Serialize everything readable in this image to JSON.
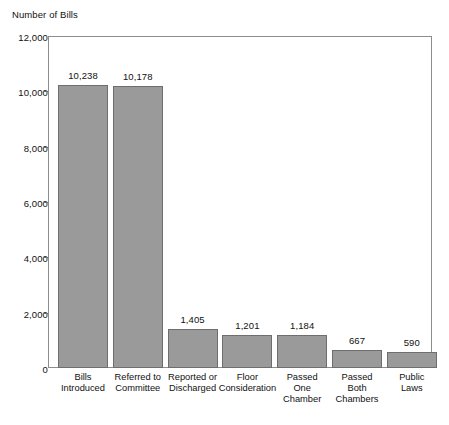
{
  "chart_data": {
    "type": "bar",
    "title": "",
    "ylabel": "Number of Bills",
    "xlabel": "",
    "ylim": [
      0,
      12000
    ],
    "grid": false,
    "legend": null,
    "y_ticks": [
      12000,
      10000,
      8000,
      6000,
      4000,
      2000,
      0
    ],
    "y_tick_labels": [
      "12,000",
      "10,000",
      "8,000",
      "6,000",
      "4,000",
      "2,000",
      "0"
    ],
    "categories": [
      "Bills Introduced",
      "Referred to Committee",
      "Reported or Discharged",
      "Floor Consideration",
      "Passed One Chamber",
      "Passed Both Chambers",
      "Public Laws"
    ],
    "category_lines": [
      [
        "Bills",
        "Introduced"
      ],
      [
        "Referred to",
        "Committee"
      ],
      [
        "Reported or",
        "Discharged"
      ],
      [
        "Floor",
        "Consideration"
      ],
      [
        "Passed",
        "One",
        "Chamber"
      ],
      [
        "Passed",
        "Both",
        "Chambers"
      ],
      [
        "Public",
        "Laws"
      ]
    ],
    "values": [
      10238,
      10178,
      1405,
      1201,
      1184,
      667,
      590
    ],
    "value_labels": [
      "10,238",
      "10,178",
      "1,405",
      "1,201",
      "1,184",
      "667",
      "590"
    ],
    "bar_color": "#9a9a9a",
    "bar_edge_color": "#6e6e6e",
    "axis_color": "#8d8d8d"
  },
  "caption": {
    "source_text": ""
  }
}
